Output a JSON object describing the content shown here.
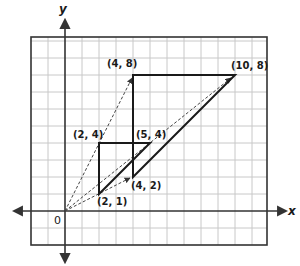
{
  "diagram": {
    "type": "coordinate-plane-dilation",
    "axes": {
      "x_label": "x",
      "y_label": "y",
      "origin_label": "0"
    },
    "grid": {
      "x_min": -2,
      "x_max": 12,
      "y_min": -2,
      "y_max": 10,
      "unit_px": 17,
      "origin_px": [
        65,
        211
      ]
    },
    "shapes": [
      {
        "name": "small-triangle",
        "vertices": [
          [
            2,
            1
          ],
          [
            2,
            4
          ],
          [
            5,
            4
          ]
        ],
        "labels": [
          "(2, 1)",
          "(2, 4)",
          "(5, 4)"
        ]
      },
      {
        "name": "large-triangle",
        "vertices": [
          [
            4,
            2
          ],
          [
            4,
            8
          ],
          [
            10,
            8
          ]
        ],
        "labels": [
          "(4, 2)",
          "(4, 8)",
          "(10, 8)"
        ]
      }
    ],
    "dashed_rays": [
      {
        "from": [
          0,
          0
        ],
        "to": [
          4,
          8
        ]
      },
      {
        "from": [
          0,
          0
        ],
        "to": [
          10,
          8
        ]
      },
      {
        "from": [
          0,
          0
        ],
        "to": [
          4,
          2
        ]
      }
    ],
    "point_labels": {
      "p21": "(2, 1)",
      "p24": "(2, 4)",
      "p54": "(5, 4)",
      "p42": "(4, 2)",
      "p48": "(4, 8)",
      "p108": "(10, 8)"
    },
    "colors": {
      "grid": "#c8c8c8",
      "border": "#333333",
      "axis": "#333333",
      "shape": "#1a1a1a",
      "dashed": "#444444"
    }
  }
}
